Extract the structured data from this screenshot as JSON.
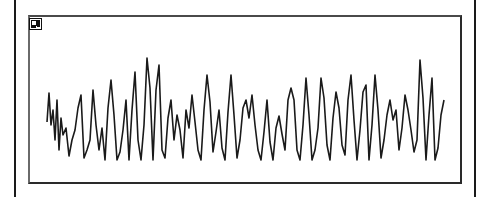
{
  "window": {
    "corner_icon": "panel-icon"
  },
  "colors": {
    "trace": "#1a1a1a",
    "frame": "#2a2a2a",
    "background": "#ffffff"
  },
  "chart_data": {
    "type": "line",
    "title": "",
    "xlabel": "",
    "ylabel": "",
    "grid": false,
    "legend": null,
    "note": "Unlabeled oscillating waveform trace (pixel coordinates, y increases downward)",
    "x": [
      47,
      49,
      51,
      53,
      55,
      57,
      59,
      61,
      63,
      66,
      69,
      72,
      75,
      78,
      81,
      84,
      87,
      90,
      93,
      96,
      99,
      102,
      105,
      108,
      111,
      114,
      117,
      120,
      123,
      126,
      129,
      132,
      135,
      138,
      141,
      144,
      147,
      150,
      153,
      156,
      159,
      162,
      165,
      168,
      171,
      174,
      177,
      180,
      183,
      186,
      189,
      192,
      195,
      198,
      201,
      204,
      207,
      210,
      213,
      216,
      219,
      222,
      225,
      228,
      231,
      234,
      237,
      240,
      243,
      246,
      249,
      252,
      255,
      258,
      261,
      264,
      267,
      270,
      273,
      276,
      279,
      282,
      285,
      288,
      291,
      294,
      297,
      300,
      303,
      306,
      309,
      312,
      315,
      318,
      321,
      324,
      327,
      330,
      333,
      336,
      339,
      342,
      345,
      348,
      351,
      354,
      357,
      360,
      363,
      366,
      369,
      372,
      375,
      378,
      381,
      384,
      387,
      390,
      393,
      396,
      399,
      402,
      405,
      408,
      411,
      414,
      417,
      420,
      423,
      426,
      429,
      432,
      435,
      438,
      441,
      444
    ],
    "y": [
      122,
      93,
      125,
      110,
      140,
      100,
      150,
      118,
      135,
      128,
      156,
      140,
      130,
      108,
      95,
      158,
      150,
      140,
      90,
      125,
      150,
      128,
      160,
      108,
      80,
      115,
      160,
      152,
      130,
      100,
      160,
      110,
      72,
      140,
      160,
      125,
      58,
      88,
      160,
      90,
      65,
      150,
      158,
      118,
      100,
      140,
      115,
      130,
      158,
      110,
      128,
      95,
      122,
      150,
      160,
      110,
      75,
      102,
      152,
      132,
      110,
      148,
      160,
      112,
      75,
      115,
      158,
      140,
      108,
      100,
      118,
      95,
      125,
      150,
      160,
      132,
      100,
      142,
      160,
      128,
      116,
      134,
      150,
      100,
      88,
      100,
      150,
      160,
      125,
      78,
      115,
      160,
      150,
      128,
      78,
      98,
      145,
      160,
      118,
      92,
      108,
      145,
      155,
      100,
      75,
      120,
      160,
      130,
      92,
      85,
      160,
      125,
      75,
      110,
      158,
      140,
      115,
      100,
      120,
      110,
      150,
      128,
      95,
      110,
      130,
      152,
      140,
      60,
      98,
      160,
      115,
      78,
      160,
      148,
      115,
      100,
      120
    ],
    "ylim_px": [
      15,
      184
    ],
    "xlim_px": [
      28,
      462
    ]
  }
}
